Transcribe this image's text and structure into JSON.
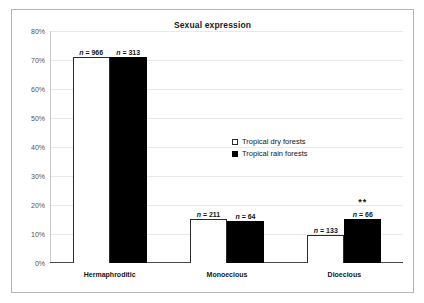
{
  "chart_data": {
    "type": "bar",
    "title": "Sexual expression",
    "xlabel": "",
    "ylabel": "",
    "categories": [
      "Hermaphroditic",
      "Monoecious",
      "Dioecious"
    ],
    "series": [
      {
        "name": "Tropical dry forests",
        "color": "#ffffff",
        "values": [
          71,
          15.2,
          9.5
        ],
        "point_labels": [
          "n = 966",
          "n = 211",
          "n = 133"
        ],
        "n_values": [
          966,
          211,
          133
        ]
      },
      {
        "name": "Tropical rain forests",
        "color": "#000000",
        "values": [
          71,
          14.5,
          15.2
        ],
        "point_labels": [
          "n = 313",
          "n = 64",
          "n = 66"
        ],
        "n_values": [
          313,
          64,
          66
        ]
      }
    ],
    "ylim": [
      0,
      80
    ],
    "yticks": [
      0,
      10,
      20,
      30,
      40,
      50,
      60,
      70,
      80
    ],
    "ytick_labels": [
      "0%",
      "10%",
      "20%",
      "30%",
      "40%",
      "50%",
      "60%",
      "70%",
      "80%"
    ],
    "grid": true,
    "legend_position": "center",
    "annotations": [
      {
        "text": "**",
        "category": "Dioecious",
        "series": "Tropical rain forests",
        "meaning": "significance-marker"
      }
    ]
  },
  "legend": {
    "entries": [
      {
        "label": "Tropical dry forests",
        "swatch": "open-square-icon"
      },
      {
        "label": "Tropical rain forests",
        "swatch": "filled-square-icon"
      }
    ]
  }
}
